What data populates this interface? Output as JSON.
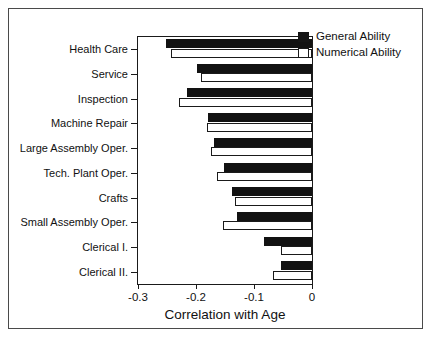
{
  "chart_data": {
    "type": "bar",
    "orientation": "horizontal",
    "title": "",
    "xlabel": "Correlation with Age",
    "ylabel": "",
    "xlim": [
      -0.3,
      0
    ],
    "xticks": [
      -0.3,
      -0.2,
      -0.1,
      0
    ],
    "xtick_labels": [
      "-0.3",
      "-0.2",
      "-0.1",
      "0"
    ],
    "grid": false,
    "legend_position": "top-right",
    "categories": [
      "Health Care",
      "Service",
      "Inspection",
      "Machine Repair",
      "Large Assembly Oper.",
      "Tech. Plant Oper.",
      "Crafts",
      "Small Assembly Oper.",
      "Clerical I.",
      "Clerical II."
    ],
    "series": [
      {
        "name": "General Ability",
        "color": "#121212",
        "values": [
          -0.251,
          -0.199,
          -0.216,
          -0.18,
          -0.169,
          -0.152,
          -0.138,
          -0.13,
          -0.083,
          -0.054
        ]
      },
      {
        "name": "Numerical Ability",
        "color": "#ffffff",
        "values": [
          -0.243,
          -0.192,
          -0.229,
          -0.181,
          -0.175,
          -0.164,
          -0.133,
          -0.154,
          -0.053,
          -0.068
        ]
      }
    ]
  },
  "legend": {
    "items": [
      {
        "label": "General Ability",
        "swatch": "filled-black-square"
      },
      {
        "label": "Numerical Ability",
        "swatch": "open-white-square"
      }
    ]
  },
  "axes": {
    "x_axis_label": "Correlation with Age",
    "x_tick_labels": [
      "-0.3",
      "-0.2",
      "-0.1",
      "0"
    ]
  }
}
